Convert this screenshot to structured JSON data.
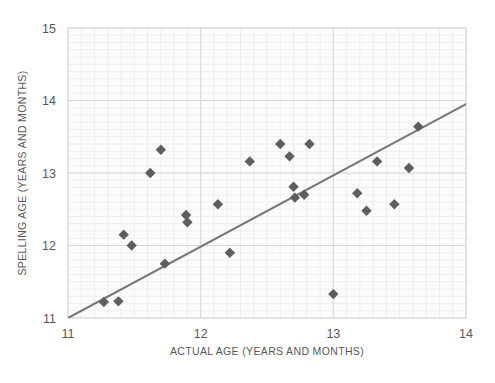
{
  "chart_data": {
    "type": "scatter",
    "title": "",
    "xlabel": "ACTUAL AGE (YEARS AND MONTHS)",
    "ylabel": "SPELLING AGE (YEARS AND MONTHS)",
    "xlim": [
      11,
      14
    ],
    "ylim": [
      11,
      15
    ],
    "xticks": [
      11,
      12,
      13,
      14
    ],
    "yticks": [
      11,
      12,
      13,
      14,
      15
    ],
    "xtick_labels": [
      "11",
      "12",
      "13",
      "14"
    ],
    "ytick_labels": [
      "11",
      "12",
      "13",
      "14",
      "15"
    ],
    "grid": true,
    "minor_grid": true,
    "legend": "none",
    "series": [
      {
        "name": "pupils",
        "marker": "diamond",
        "color": "#5e5e60",
        "points": [
          [
            11.27,
            11.22
          ],
          [
            11.38,
            11.23
          ],
          [
            11.42,
            12.15
          ],
          [
            11.48,
            12.0
          ],
          [
            11.62,
            13.0
          ],
          [
            11.7,
            13.32
          ],
          [
            11.73,
            11.75
          ],
          [
            11.89,
            12.42
          ],
          [
            11.9,
            12.32
          ],
          [
            12.13,
            12.57
          ],
          [
            12.22,
            11.9
          ],
          [
            12.37,
            13.16
          ],
          [
            12.6,
            13.4
          ],
          [
            12.67,
            13.23
          ],
          [
            12.7,
            12.81
          ],
          [
            12.71,
            12.66
          ],
          [
            12.78,
            12.7
          ],
          [
            12.82,
            13.4
          ],
          [
            13.0,
            11.33
          ],
          [
            13.18,
            12.72
          ],
          [
            13.25,
            12.48
          ],
          [
            13.33,
            13.16
          ],
          [
            13.46,
            12.57
          ],
          [
            13.57,
            13.07
          ],
          [
            13.64,
            13.64
          ]
        ]
      }
    ],
    "trendline": {
      "name": "line-of-best-fit",
      "color": "#77777a",
      "x_start": 11.0,
      "y_start": 11.0,
      "x_end": 14.0,
      "y_end": 13.95
    },
    "colors": {
      "marker": "#5e5e60",
      "trendline": "#77777a",
      "axis_text": "#58585a",
      "grid_major": "#d8d8dc",
      "grid_minor": "#eeeef0",
      "plot_border": "#cfcfd4",
      "background": "#ffffff"
    }
  }
}
